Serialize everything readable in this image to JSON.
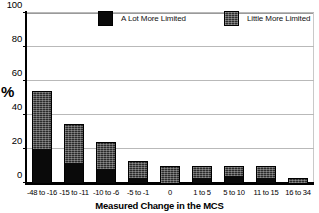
{
  "chart_data": {
    "type": "bar",
    "subtype": "stacked-bar",
    "title": "",
    "xlabel": "Measured Change in the MCS",
    "ylabel": "%",
    "ylim": [
      0,
      100
    ],
    "yticks": [
      0,
      20,
      40,
      60,
      80,
      100
    ],
    "grid": true,
    "legend_position": "top-center",
    "categories": [
      "-48 to -16",
      "-15 to -11",
      "-10 to -6",
      "-5 to -1",
      "0",
      "1 to 5",
      "5 to 10",
      "11 to 15",
      "16 to 34"
    ],
    "series": [
      {
        "name": "A Lot More Limited",
        "color": "#0a0a0a",
        "values": [
          20,
          12,
          8,
          3,
          0,
          3,
          4,
          3,
          0
        ]
      },
      {
        "name": "Little More Limited",
        "color": "#2b2b2b",
        "values": [
          34,
          23,
          16,
          10,
          10,
          7,
          6,
          7,
          3
        ]
      }
    ],
    "totals": [
      54,
      35,
      24,
      13,
      10,
      10,
      10,
      10,
      3
    ]
  },
  "axis": {
    "y_title": "%",
    "x_title": "Measured Change in the MCS"
  },
  "legend": {
    "items": [
      {
        "label": "A Lot More Limited",
        "swatch": "dark-solid-swatch"
      },
      {
        "label": "Little More Limited",
        "swatch": "gray-hatched-swatch"
      }
    ]
  }
}
